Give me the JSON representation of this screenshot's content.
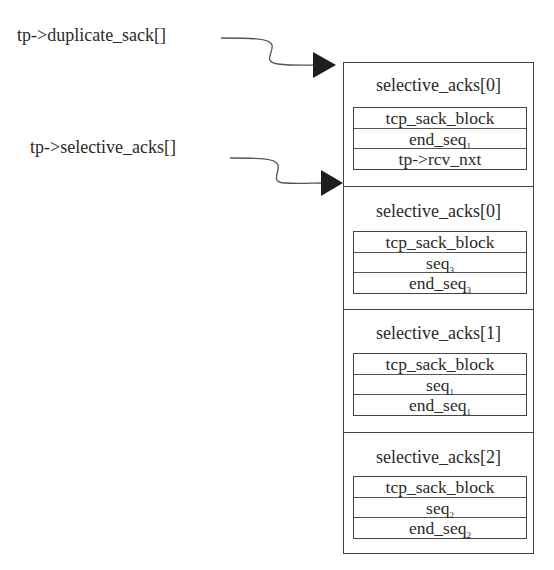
{
  "pointers": [
    {
      "label": "tp->duplicate_sack[]",
      "target_section": 0
    },
    {
      "label": "tp->selective_acks[]",
      "target_section": 1
    }
  ],
  "sections": [
    {
      "title": "selective_acks[0]",
      "rows": [
        {
          "text": "tcp_sack_block",
          "sub": ""
        },
        {
          "text": "end_seq",
          "sub": "1"
        },
        {
          "text": "tp->rcv_nxt",
          "sub": ""
        }
      ]
    },
    {
      "title": "selective_acks[0]",
      "rows": [
        {
          "text": "tcp_sack_block",
          "sub": ""
        },
        {
          "text": "seq",
          "sub": "3"
        },
        {
          "text": "end_seq",
          "sub": "3"
        }
      ]
    },
    {
      "title": "selective_acks[1]",
      "rows": [
        {
          "text": "tcp_sack_block",
          "sub": ""
        },
        {
          "text": "seq",
          "sub": "1"
        },
        {
          "text": "end_seq",
          "sub": "1"
        }
      ]
    },
    {
      "title": "selective_acks[2]",
      "rows": [
        {
          "text": "tcp_sack_block",
          "sub": ""
        },
        {
          "text": "seq",
          "sub": "2"
        },
        {
          "text": "end_seq",
          "sub": "2"
        }
      ]
    }
  ],
  "colors": {
    "line": "#444444",
    "text": "#2a2a2a",
    "arrowhead": "#1e1e1e"
  }
}
